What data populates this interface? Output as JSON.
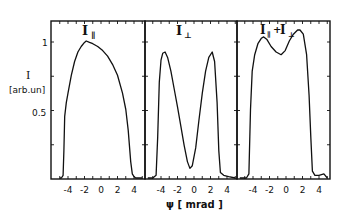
{
  "chart_data": [
    {
      "type": "line",
      "title": "I∥",
      "xlabel": "ψ [mrad]",
      "ylabel": "I [arb.un]",
      "xlim": [
        -6,
        5.5
      ],
      "ylim": [
        0,
        1.1
      ],
      "xticks": [
        "-4",
        "-2",
        "0",
        "2",
        "4"
      ],
      "yticks": [
        "0.5",
        "1"
      ],
      "series": [
        {
          "name": "I∥",
          "x": [
            -5.0,
            -4.8,
            -4.6,
            -4.5,
            -4.4,
            -4.2,
            -4.0,
            -3.6,
            -3.2,
            -2.8,
            -2.4,
            -2.0,
            -1.8,
            -1.4,
            -1.0,
            -0.4,
            0.2,
            0.8,
            1.4,
            2.0,
            2.6,
            3.0,
            3.3,
            3.6,
            3.8,
            4.0,
            4.2,
            4.6,
            5.0
          ],
          "y": [
            0.0,
            0.0,
            0.02,
            0.2,
            0.45,
            0.55,
            0.62,
            0.75,
            0.85,
            0.92,
            0.96,
            0.99,
            1.0,
            0.99,
            0.98,
            0.96,
            0.93,
            0.89,
            0.83,
            0.75,
            0.62,
            0.5,
            0.35,
            0.12,
            0.03,
            0.01,
            0.0,
            0.0,
            0.0
          ]
        }
      ]
    },
    {
      "type": "line",
      "title": "I⊥",
      "xlabel": "ψ [mrad]",
      "xlim": [
        -6,
        5.5
      ],
      "ylim": [
        0,
        1.1
      ],
      "xticks": [
        "-4",
        "-2",
        "0",
        "2",
        "4"
      ],
      "series": [
        {
          "name": "I⊥",
          "x": [
            -5.6,
            -5.0,
            -4.6,
            -4.4,
            -4.2,
            -4.0,
            -3.8,
            -3.5,
            -3.2,
            -2.8,
            -2.4,
            -2.0,
            -1.6,
            -1.2,
            -0.8,
            -0.5,
            -0.2,
            0.2,
            0.6,
            1.0,
            1.4,
            1.8,
            2.2,
            2.5,
            2.8,
            3.0,
            3.2,
            3.6,
            4.2,
            5.0
          ],
          "y": [
            0.0,
            0.0,
            0.02,
            0.3,
            0.7,
            0.86,
            0.91,
            0.92,
            0.88,
            0.78,
            0.65,
            0.52,
            0.38,
            0.24,
            0.12,
            0.07,
            0.09,
            0.22,
            0.42,
            0.62,
            0.78,
            0.88,
            0.92,
            0.85,
            0.55,
            0.2,
            0.04,
            0.02,
            0.01,
            0.0
          ]
        }
      ]
    },
    {
      "type": "line",
      "title": "I∥+I⊥",
      "xlabel": "ψ [mrad]",
      "xlim": [
        -6,
        5.5
      ],
      "ylim": [
        0,
        1.1
      ],
      "xticks": [
        "-4",
        "-2",
        "0",
        "2",
        "4"
      ],
      "series": [
        {
          "name": "I∥+I⊥",
          "x": [
            -5.6,
            -4.8,
            -4.5,
            -4.3,
            -4.1,
            -3.8,
            -3.4,
            -3.0,
            -2.7,
            -2.3,
            -1.8,
            -1.2,
            -0.6,
            -0.1,
            0.4,
            0.9,
            1.4,
            1.7,
            2.1,
            2.5,
            2.8,
            3.0,
            3.2,
            3.5,
            4.0,
            4.6,
            5.0
          ],
          "y": [
            0.0,
            0.0,
            0.03,
            0.5,
            0.78,
            0.9,
            0.98,
            1.02,
            1.03,
            1.01,
            0.96,
            0.92,
            0.9,
            0.93,
            1.0,
            1.05,
            1.08,
            1.08,
            1.05,
            0.9,
            0.6,
            0.3,
            0.05,
            0.02,
            0.02,
            0.03,
            0.0
          ]
        }
      ]
    }
  ],
  "labels": {
    "y_axis_main": "I",
    "y_axis_unit": "[arb.un]",
    "ytick_1": "1",
    "ytick_05": "0.5",
    "x_axis": "ψ  [ mrad ]",
    "panel1_title": "I",
    "panel1_sub": "∥",
    "panel2_title": "I",
    "panel2_sub": "⊥",
    "panel3_title_a": "I",
    "panel3_sub_a": "∥",
    "panel3_plus": "+",
    "panel3_title_b": "I",
    "panel3_sub_b": "⊥",
    "xticks": [
      "-4",
      "-2",
      "0",
      "2",
      "4"
    ]
  }
}
